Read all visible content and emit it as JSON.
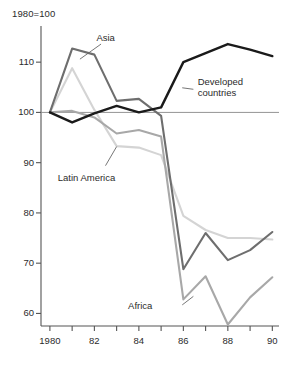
{
  "chart_data": {
    "type": "line",
    "title": "1980=100",
    "xlabel": "",
    "ylabel": "",
    "x": [
      1980,
      1981,
      1982,
      1983,
      1984,
      1985,
      1986,
      1987,
      1988,
      1989,
      1990
    ],
    "xtick_labels": [
      "1980",
      "82",
      "84",
      "86",
      "88",
      "90"
    ],
    "xtick_values": [
      1980,
      1982,
      1984,
      1986,
      1988,
      1990
    ],
    "ytick_labels": [
      "110",
      "100",
      "90",
      "80",
      "70",
      "60"
    ],
    "ytick_values": [
      110,
      100,
      90,
      80,
      70,
      60
    ],
    "xlim": [
      1979.6,
      1990.3
    ],
    "ylim": [
      57.5,
      116
    ],
    "grid": false,
    "legend_position": "inline-annotations",
    "reference_line": 100,
    "series": [
      {
        "name": "Developed countries",
        "color": "#1a1a1a",
        "width": 2.4,
        "values": [
          100.0,
          98.0,
          99.8,
          101.3,
          100.0,
          101.0,
          110.0,
          111.8,
          113.6,
          112.5,
          111.2
        ]
      },
      {
        "name": "Asia",
        "color": "#6e6e6e",
        "width": 2.1,
        "values": [
          100.0,
          112.7,
          111.5,
          102.3,
          102.7,
          99.3,
          68.8,
          76.0,
          70.6,
          72.6,
          76.2
        ]
      },
      {
        "name": "Latin America",
        "color": "#d4d4d4",
        "width": 2.1,
        "values": [
          100.0,
          108.8,
          100.5,
          93.3,
          93.0,
          91.5,
          79.4,
          76.6,
          75.0,
          75.0,
          74.7
        ]
      },
      {
        "name": "Africa",
        "color": "#a8a8a8",
        "width": 2.1,
        "values": [
          100.0,
          100.3,
          99.0,
          95.8,
          96.5,
          95.2,
          62.8,
          67.4,
          57.8,
          63.2,
          67.2
        ]
      }
    ],
    "annotations": [
      {
        "text": "Asia",
        "x": 1982.0,
        "y": 114.8
      },
      {
        "text": "Developed countries",
        "x": 1986.6,
        "y": 105.0
      },
      {
        "text": "Latin America",
        "x": 1981.6,
        "y": 87.0
      },
      {
        "text": "Africa",
        "x": 1985.0,
        "y": 61.5
      }
    ]
  }
}
